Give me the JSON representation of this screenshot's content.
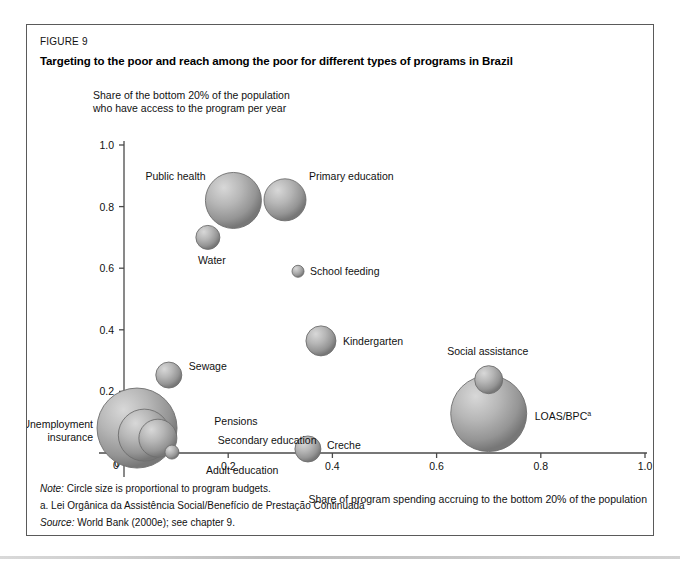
{
  "figure": {
    "number": "FIGURE 9",
    "title": "Targeting to the poor and reach among the poor for different types of programs in Brazil"
  },
  "notes": {
    "note_label": "Note:",
    "note_text": "Circle size is proportional to program budgets.",
    "footnote": "a. Lei Orgânica da Assistência Social/Benefício de Prestação Continuada",
    "source_label": "Source:",
    "source_text": "World Bank (2000e); see chapter 9."
  },
  "chart_data": {
    "type": "scatter",
    "title": "Targeting to the poor and reach among the poor for different types of programs in Brazil",
    "xlabel": "Share of program spending accruing to the bottom 20% of the population",
    "ylabel": "Share of the bottom 20% of the population who have access to the program per year",
    "ylabel_line1": "Share of the bottom 20% of the population",
    "ylabel_line2": "who have access to the program per year",
    "xlim": [
      0,
      1.0
    ],
    "ylim": [
      0,
      1.0
    ],
    "xticks": [
      "0",
      "0.2",
      "0.4",
      "0.6",
      "0.8",
      "1.0"
    ],
    "xtick_values": [
      0,
      0.2,
      0.4,
      0.6,
      0.8,
      1.0
    ],
    "yticks": [
      "0",
      "0.2",
      "0.4",
      "0.6",
      "0.8",
      "1.0"
    ],
    "ytick_values": [
      0,
      0.2,
      0.4,
      0.6,
      0.8,
      1.0
    ],
    "grid": false,
    "legend": "none",
    "size_note": "Circle size is proportional to program budgets.",
    "points": [
      {
        "label": "Public health",
        "x": 0.21,
        "y": 0.82,
        "r": 28,
        "label_dx": -88,
        "label_dy": -20,
        "anchor": "start"
      },
      {
        "label": "Primary education",
        "x": 0.309,
        "y": 0.822,
        "r": 21,
        "label_dx": 24,
        "label_dy": -20,
        "anchor": "start"
      },
      {
        "label": "Water",
        "x": 0.161,
        "y": 0.7,
        "r": 12,
        "label_dx": 4,
        "label_dy": 27,
        "anchor": "middle"
      },
      {
        "label": "School feeding",
        "x": 0.334,
        "y": 0.59,
        "r": 6,
        "label_dx": 12,
        "label_dy": 4,
        "anchor": "start"
      },
      {
        "label": "Kindergarten",
        "x": 0.378,
        "y": 0.364,
        "r": 15,
        "label_dx": 22,
        "label_dy": 4,
        "anchor": "start"
      },
      {
        "label": "Sewage",
        "x": 0.086,
        "y": 0.253,
        "r": 13,
        "label_dx": 20,
        "label_dy": -5,
        "anchor": "start"
      },
      {
        "label": "Unemployment insurance",
        "x": 0.025,
        "y": 0.081,
        "r": 40,
        "label_dx": -44,
        "label_dy": 6,
        "anchor": "end",
        "two_line": true
      },
      {
        "label": "Pensions",
        "x": 0.039,
        "y": 0.058,
        "r": 26,
        "label_dx": 70,
        "label_dy": -10,
        "anchor": "start"
      },
      {
        "label": "Secondary  education",
        "x": 0.065,
        "y": 0.048,
        "r": 19,
        "label_dx": 60,
        "label_dy": 6,
        "anchor": "start"
      },
      {
        "label": "Adult education",
        "x": 0.092,
        "y": 0.003,
        "r": 7,
        "label_dx": 34,
        "label_dy": 22,
        "anchor": "start"
      },
      {
        "label": "Creche",
        "x": 0.353,
        "y": 0.013,
        "r": 13,
        "label_dx": 19,
        "label_dy": 0,
        "anchor": "start"
      },
      {
        "label": "Social assistance",
        "x": 0.7,
        "y": 0.238,
        "r": 14,
        "label_dx": -1,
        "label_dy": -25,
        "anchor": "middle"
      },
      {
        "label": "LOAS/BPC",
        "x": 0.7,
        "y": 0.128,
        "r": 38,
        "label_dx": 46,
        "label_dy": 6,
        "anchor": "start",
        "sup": "a"
      }
    ]
  }
}
